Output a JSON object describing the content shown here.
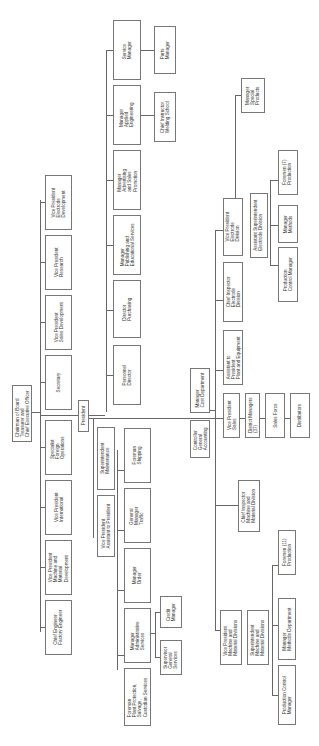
{
  "chart_title": "Organization Chart",
  "orientation": "rotated-90",
  "nodes": {
    "chairman": "Chairman of Board\nTreasurer and\nChief Executive Officer",
    "president": "President",
    "secretary": "Secretary",
    "vp_sales_dev": "Vice President\nSales Development",
    "vp_research": "Vice President\nResearch",
    "vp_electrode_dev": "Vice President\nElectrode\nDevelopment",
    "specialist_foreign": "Specialist\nForeign\nOperations",
    "vp_international": "Vice President\nInternational",
    "vp_machine_dev": "Vice President\nMachine and\nMaterial\nDevelopment",
    "chief_engineer": "Chief Engineer\nFactory Engineer",
    "personnel_director": "Personnel\nDirector",
    "director_purchasing": "Director\nPurchasing",
    "mgr_publishing": "Manager\nPublishing and\nEducational Services",
    "mgr_advertising": "Manager\nAdvertising\nand Sales\nPromotion",
    "mgr_applied_eng": "Manager\nApplied\nEngineering",
    "service_manager": "Service\nManager",
    "chief_instructor": "Chief Instructor\nWelding School",
    "parts_manager": "Parts\nManager",
    "superintendent_maintenance": "Superintendent\nMaintenance",
    "vp_assistant": "Vice President\nAssistant to President",
    "foreman_shipping": "Foreman\nShipping",
    "gm_traffic": "General\nManager\nTraffic",
    "manager_order": "Manager\nOrder",
    "mgr_admin_services": "Manager\nAdministrative\nServices",
    "foreman_plant": "Foreman\nPlant Protection,\nSalvage,\nCustodian Services",
    "credit_manager": "Credit\nManager",
    "supervisor_general": "Supervisor\nGeneral\nServices",
    "mgr_cost": "Manager\nCost Department",
    "controller": "Controller\nGeneral\nAccounting",
    "vp_sales": "Vice President\nSales",
    "district_managers": "District Managers\n(37)",
    "sales_force": "Sales Force",
    "distributors": "Distributors",
    "asst_president_plant": "Assistant to\nPresident\nPlant and Equipment",
    "chief_inspector_electrode": "Chief Inspector\nElectrode\nDivision",
    "vp_electrode_div": "Vice President\nElectrode\nDivision",
    "asst_supt_electrode": "Assistant Superintendent\nElectrode Division",
    "prod_control_electrode": "Production\nControl Manager",
    "mgr_methods": "Manager\nMethods",
    "foremen_7": "Foremen (7)\nProduction",
    "mgr_special_products": "Manager\nSpecial\nProducts",
    "chief_inspector_machine": "Chief Inspector\nMachine and\nMaterial Division",
    "vp_machine_div": "Vice President\nMachine and\nMaterial Divisions",
    "supt_machine": "Superintendent\nMachine and\nMaterial Divisions",
    "prod_control_machine": "Production Control\nManager",
    "mgr_methods_dept": "Manager\nMethods Department",
    "foremen_11": "Foremen (11)\nProduction"
  }
}
